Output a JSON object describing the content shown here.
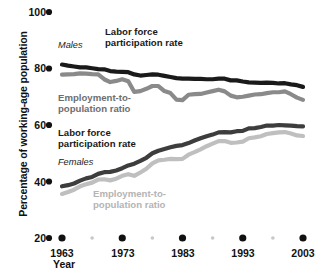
{
  "chart_data": {
    "type": "line",
    "title": "",
    "xlabel": "Year",
    "ylabel": "Percentage of working-age population",
    "xlim": [
      1963,
      2003
    ],
    "ylim": [
      20,
      100
    ],
    "grid": false,
    "legend_position": "in-plot annotations",
    "y_ticks": [
      100,
      80,
      60,
      40,
      20
    ],
    "x_ticks": [
      1963,
      1973,
      1983,
      1993,
      2003
    ],
    "x_minor_ticks": [
      1968,
      1978,
      1988,
      1998
    ],
    "group_labels": [
      {
        "name": "males-group-label",
        "text": "Males"
      },
      {
        "name": "females-group-label",
        "text": "Females"
      }
    ],
    "annotations": [
      {
        "name": "males-lfpr-label",
        "text": "Labor force\nparticipation rate",
        "color": "#1a1a1a"
      },
      {
        "name": "males-epr-label",
        "text": "Employment-to-\npopulation ratio",
        "color": "#6e6e6e"
      },
      {
        "name": "females-lfpr-label",
        "text": "Labor force\nparticipation rate",
        "color": "#1a1a1a"
      },
      {
        "name": "females-epr-label",
        "text": "Employment-to-\npopulation ratio",
        "color": "#b4b4b4"
      }
    ],
    "x": [
      1963,
      1964,
      1965,
      1966,
      1967,
      1968,
      1969,
      1970,
      1971,
      1972,
      1973,
      1974,
      1975,
      1976,
      1977,
      1978,
      1979,
      1980,
      1981,
      1982,
      1983,
      1984,
      1985,
      1986,
      1987,
      1988,
      1989,
      1990,
      1991,
      1992,
      1993,
      1994,
      1995,
      1996,
      1997,
      1998,
      1999,
      2000,
      2001,
      2002,
      2003
    ],
    "series": [
      {
        "name": "Males labor force participation rate",
        "group": "Males",
        "color": "#1a1a1a",
        "values": [
          81.4,
          81.0,
          80.7,
          80.4,
          80.4,
          80.1,
          79.8,
          79.7,
          79.1,
          78.9,
          78.8,
          78.7,
          77.9,
          77.5,
          77.7,
          77.9,
          77.8,
          77.4,
          77.0,
          76.6,
          76.4,
          76.4,
          76.3,
          76.3,
          76.2,
          76.2,
          76.4,
          76.4,
          75.8,
          75.8,
          75.4,
          75.1,
          75.0,
          74.9,
          75.0,
          74.9,
          74.7,
          74.8,
          74.4,
          74.1,
          73.5
        ]
      },
      {
        "name": "Males employment-to-population ratio",
        "group": "Males",
        "color": "#8a8a8a",
        "values": [
          77.8,
          77.9,
          78.0,
          78.3,
          78.2,
          78.0,
          77.9,
          76.2,
          75.2,
          75.6,
          76.2,
          75.5,
          71.7,
          72.0,
          72.8,
          73.8,
          73.8,
          72.0,
          71.3,
          69.0,
          68.8,
          70.7,
          70.9,
          71.0,
          71.5,
          72.0,
          72.5,
          71.9,
          70.4,
          69.8,
          70.0,
          70.4,
          70.8,
          70.9,
          71.3,
          71.6,
          71.6,
          71.9,
          70.9,
          69.7,
          68.9
        ]
      },
      {
        "name": "Females labor force participation rate",
        "group": "Females",
        "color": "#3d3d3d",
        "values": [
          38.3,
          38.7,
          39.3,
          40.3,
          41.1,
          41.6,
          42.7,
          43.3,
          43.4,
          43.9,
          44.7,
          45.7,
          46.3,
          47.3,
          48.4,
          50.0,
          50.9,
          51.5,
          52.1,
          52.6,
          52.9,
          53.6,
          54.5,
          55.3,
          56.0,
          56.6,
          57.4,
          57.5,
          57.4,
          57.8,
          57.9,
          58.8,
          58.9,
          59.3,
          59.8,
          59.8,
          60.0,
          59.9,
          59.8,
          59.6,
          59.5
        ]
      },
      {
        "name": "Females employment-to-population ratio",
        "group": "Females",
        "color": "#bfbfbf",
        "values": [
          35.6,
          36.3,
          37.1,
          38.3,
          39.0,
          39.6,
          40.7,
          40.8,
          40.4,
          41.0,
          42.0,
          42.6,
          42.0,
          43.2,
          44.5,
          46.4,
          47.5,
          47.7,
          48.0,
          47.9,
          48.0,
          49.5,
          50.4,
          51.4,
          52.5,
          53.4,
          54.3,
          54.3,
          53.7,
          53.8,
          54.1,
          55.3,
          55.6,
          56.0,
          56.8,
          57.1,
          57.4,
          57.5,
          57.0,
          56.3,
          56.1
        ]
      }
    ]
  },
  "axis": {
    "y_title": "Percentage of working-age population",
    "x_title": "Year",
    "y_labels": [
      "100",
      "80",
      "60",
      "40",
      "20"
    ],
    "x_labels": [
      "1963",
      "1973",
      "1983",
      "1993",
      "2003"
    ]
  },
  "labels": {
    "males": "Males",
    "females": "Females",
    "males_lfpr": "Labor force\nparticipation rate",
    "males_epr": "Employment-to-\npopulation ratio",
    "females_lfpr": "Labor force\nparticipation rate",
    "females_epr": "Employment-to-\npopulation ratio"
  },
  "colors": {
    "males_lfpr": "#1a1a1a",
    "males_epr": "#8a8a8a",
    "females_lfpr": "#3d3d3d",
    "females_epr": "#bfbfbf",
    "tick_dot": "#111111",
    "minor_dot": "#c8c8c8",
    "background": "#ffffff"
  }
}
